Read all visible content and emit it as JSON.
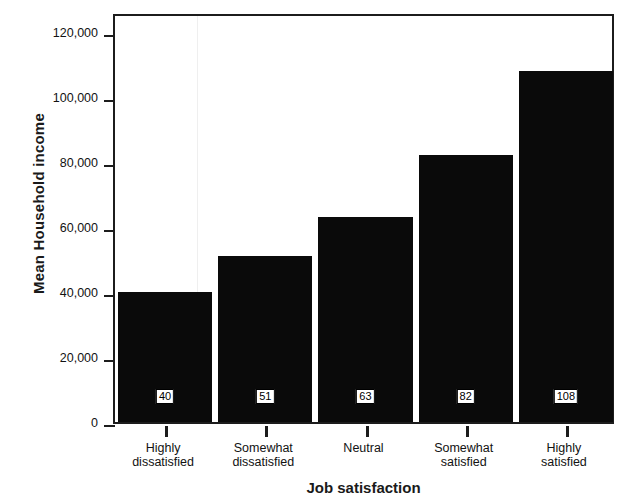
{
  "chart_data": {
    "type": "bar",
    "title": "",
    "xlabel": "Job satisfaction",
    "ylabel": "Mean Household income",
    "categories": [
      "Highly\ndissatisfied",
      "Somewhat\ndissatisfied",
      "Neutral",
      "Somewhat\nsatisfied",
      "Highly\nsatisfied"
    ],
    "category_lines": [
      [
        "Highly",
        "dissatisfied"
      ],
      [
        "Somewhat",
        "dissatisfied"
      ],
      [
        "Neutral",
        ""
      ],
      [
        "Somewhat",
        "satisfied"
      ],
      [
        "Highly",
        "satisfied"
      ]
    ],
    "values": [
      40000,
      51000,
      63000,
      82000,
      108000
    ],
    "data_labels": [
      "40",
      "51",
      "63",
      "82",
      "108"
    ],
    "ylim": [
      0,
      126000
    ],
    "yticks": [
      0,
      20000,
      40000,
      60000,
      80000,
      100000,
      120000
    ],
    "ytick_labels": [
      "0",
      "20,000",
      "40,000",
      "60,000",
      "80,000",
      "100,000",
      "120,000"
    ],
    "grid": false,
    "legend": "none",
    "bar_color": "#0a0a0a",
    "axis_color": "#1c1c1c",
    "background_color": "#ffffff"
  },
  "axes": {
    "y_title": "Mean Household income",
    "x_title": "Job satisfaction"
  },
  "y_ticks": [
    {
      "label": "120,000",
      "value": 120000
    },
    {
      "label": "100,000",
      "value": 100000
    },
    {
      "label": "80,000",
      "value": 80000
    },
    {
      "label": "60,000",
      "value": 60000
    },
    {
      "label": "40,000",
      "value": 40000
    },
    {
      "label": "20,000",
      "value": 20000
    },
    {
      "label": "0",
      "value": 0
    }
  ],
  "bars": [
    {
      "line1": "Highly",
      "line2": "dissatisfied",
      "label": "40",
      "value": 40000
    },
    {
      "line1": "Somewhat",
      "line2": "dissatisfied",
      "label": "51",
      "value": 51000
    },
    {
      "line1": "Neutral",
      "line2": "",
      "label": "63",
      "value": 63000
    },
    {
      "line1": "Somewhat",
      "line2": "satisfied",
      "label": "82",
      "value": 82000
    },
    {
      "line1": "Highly",
      "line2": "satisfied",
      "label": "108",
      "value": 108000
    }
  ]
}
